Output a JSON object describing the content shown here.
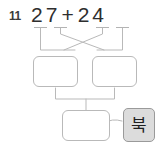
{
  "worksheet": {
    "problem_number": "11",
    "equation": {
      "left_operand": {
        "tens_digit": "2",
        "ones_digit": "7",
        "text": "27"
      },
      "operator": "+",
      "right_operand": {
        "tens_digit": "2",
        "ones_digit": "4",
        "text": "24"
      },
      "full_text": "27 + 24"
    },
    "decomposition": {
      "left_box_value": "",
      "right_box_value": "",
      "result_box_value": ""
    },
    "hint_button": {
      "label": "북"
    },
    "colors": {
      "box_border": "#b9b9b9",
      "connector_line": "#b3b3b3",
      "button_background": "#dcdcdc",
      "button_border": "#9a9a9a",
      "text": "#2e2e2e",
      "background": "#ffffff"
    }
  }
}
